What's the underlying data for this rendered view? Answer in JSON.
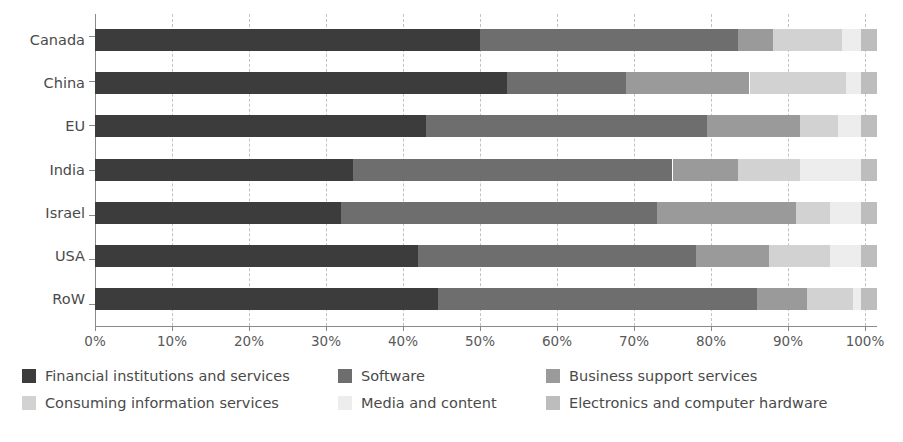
{
  "chart_data": {
    "type": "bar",
    "orientation": "horizontal",
    "stacked": true,
    "stack_mode": "percent",
    "title": "",
    "subtitle": "",
    "xlabel": "",
    "ylabel": "",
    "xlim": [
      0,
      100
    ],
    "ylim": null,
    "grid": true,
    "grid_axis": "x",
    "grid_style": "dashed",
    "legend_position": "bottom",
    "legend_columns": 3,
    "x_ticks": [
      0,
      10,
      20,
      30,
      40,
      50,
      60,
      70,
      80,
      90,
      100
    ],
    "x_tick_labels": [
      "0%",
      "10%",
      "20%",
      "30%",
      "40%",
      "50%",
      "60%",
      "70%",
      "80%",
      "90%",
      "100%"
    ],
    "categories": [
      "Canada",
      "China",
      "EU",
      "India",
      "Israel",
      "USA",
      "RoW"
    ],
    "series": [
      {
        "name": "Financial institutions and services",
        "color": "#3c3c3c",
        "values": [
          50.0,
          53.5,
          43.0,
          33.5,
          32.0,
          42.0,
          44.5
        ]
      },
      {
        "name": "Software",
        "color": "#6e6e6e",
        "values": [
          33.5,
          15.5,
          36.5,
          41.5,
          41.0,
          36.0,
          41.5
        ]
      },
      {
        "name": "Business support services",
        "color": "#9a9a9a",
        "values": [
          4.5,
          16.0,
          12.0,
          8.5,
          18.0,
          9.5,
          6.5
        ]
      },
      {
        "name": "Consuming information services",
        "color": "#d2d2d2",
        "values": [
          9.0,
          12.5,
          5.0,
          8.0,
          4.5,
          8.0,
          6.0
        ]
      },
      {
        "name": "Media and content",
        "color": "#ededed",
        "values": [
          2.5,
          2.0,
          3.0,
          8.0,
          4.0,
          4.0,
          1.0
        ]
      },
      {
        "name": "Electronics and computer hardware",
        "color": "#bdbdbd",
        "values": [
          2.0,
          2.0,
          2.0,
          2.0,
          2.0,
          2.0,
          2.0
        ]
      }
    ]
  },
  "legend": {
    "items": [
      {
        "label": "Financial institutions and services",
        "color": "#3c3c3c"
      },
      {
        "label": "Software",
        "color": "#6e6e6e"
      },
      {
        "label": "Business support services",
        "color": "#9a9a9a"
      },
      {
        "label": "Consuming information services",
        "color": "#d2d2d2"
      },
      {
        "label": "Media and content",
        "color": "#ededed"
      },
      {
        "label": "Electronics and computer hardware",
        "color": "#bdbdbd"
      }
    ]
  },
  "axis": {
    "x_tick_labels": [
      "0%",
      "10%",
      "20%",
      "30%",
      "40%",
      "50%",
      "60%",
      "70%",
      "80%",
      "90%",
      "100%"
    ],
    "y_category_labels": [
      "Canada",
      "China",
      "EU",
      "India",
      "Israel",
      "USA",
      "RoW"
    ]
  },
  "colors": {
    "axis_line": "#8a8a8a",
    "gridline": "#c2c2c2",
    "text": "#4a4a4a",
    "background": "#ffffff"
  }
}
